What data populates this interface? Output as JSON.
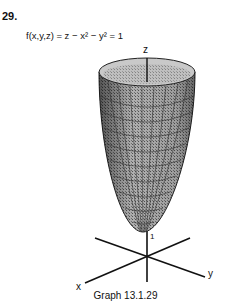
{
  "problem": {
    "number": "29."
  },
  "equation": {
    "text": "f(x,y,z) = z − x² − y² = 1"
  },
  "graph": {
    "surface": "paraboloid",
    "axes": {
      "x_label": "x",
      "y_label": "y",
      "z_label": "z"
    },
    "vertex_label": "1",
    "caption": "Graph 13.1.29"
  }
}
